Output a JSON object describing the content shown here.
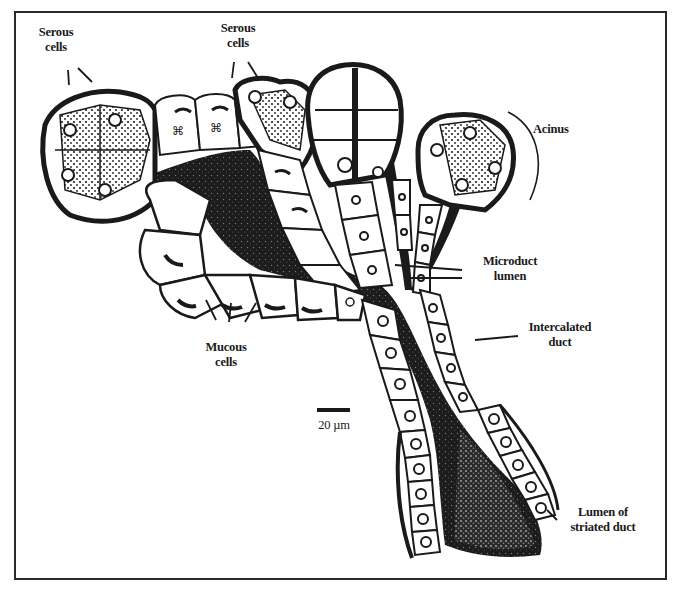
{
  "figure": {
    "type": "histology-diagram",
    "colors": {
      "ink": "#1a1a1a",
      "background": "#ffffff",
      "cell_fill": "#ffffff"
    }
  },
  "labels": {
    "serous_left": {
      "line1": "Serous",
      "line2": "cells"
    },
    "serous_top": {
      "line1": "Serous",
      "line2": "cells"
    },
    "acinus": {
      "line1": "Acinus"
    },
    "microduct": {
      "line1": "Microduct",
      "line2": "lumen"
    },
    "intercalated": {
      "line1": "Intercalated",
      "line2": "duct"
    },
    "mucous": {
      "line1": "Mucous",
      "line2": "cells"
    },
    "striated": {
      "line1": "Lumen of",
      "line2": "striated duct"
    }
  },
  "scale_bar": {
    "label": "20 µm"
  }
}
